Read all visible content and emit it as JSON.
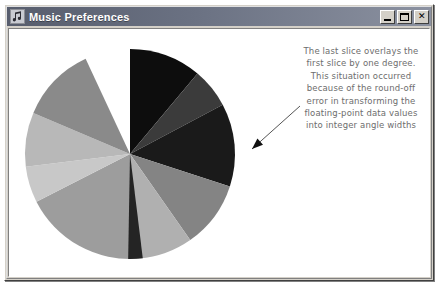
{
  "window": {
    "title": "Music Preferences",
    "icon": "music-note-icon",
    "controls": [
      {
        "name": "minimize",
        "label": "_"
      },
      {
        "name": "maximize",
        "label": "□"
      },
      {
        "name": "close",
        "label": "✕"
      }
    ]
  },
  "annotation": {
    "lines": [
      "The last slice overlays the",
      "first slice by one degree.",
      "This situation occurred",
      "because of the round-off",
      "error in transforming the",
      "floating-point data values",
      "into integer angle widths"
    ],
    "color": "#6d6d6d",
    "arrow": {
      "from_x": 291,
      "from_y": 77,
      "to_x": 243,
      "to_y": 120
    }
  },
  "chart_data": {
    "type": "pie",
    "title": "",
    "center_x": 121,
    "center_y": 125,
    "radius": 105,
    "start_angle_deg": -90,
    "note": "Slices drawn clockwise from 12 o'clock; last slice overlaps the first by one degree due to round-off error.",
    "categories": [
      "Slice 1",
      "Slice 2",
      "Slice 3",
      "Slice 4",
      "Slice 5",
      "Slice 6",
      "Slice 7",
      "Slice 8",
      "Slice 9"
    ],
    "values": [
      16,
      9,
      19,
      15,
      12,
      28,
      8,
      12,
      17
    ],
    "angles_deg": [
      40,
      22,
      46,
      37,
      30,
      68,
      20,
      30,
      42
    ],
    "colors": [
      "#0d0d0d",
      "#3b3b3b",
      "#1a1a1a",
      "#848484",
      "#b0b0b0",
      "#9d9d9d",
      "#c8c8c8",
      "#b8b8b8",
      "#8a8a8a"
    ],
    "overlap_slice": {
      "label": "overlap-sliver",
      "color": "#242424",
      "start_angle_deg": 83,
      "end_angle_deg": 91
    },
    "legend": "none",
    "grid": false
  }
}
